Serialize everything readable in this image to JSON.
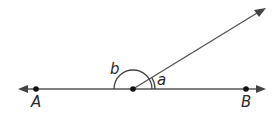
{
  "diagram": {
    "type": "geometry-angles",
    "points": [
      {
        "id": "A",
        "label": "A"
      },
      {
        "id": "O",
        "label": ""
      },
      {
        "id": "B",
        "label": "B"
      }
    ],
    "angles": [
      {
        "id": "a",
        "label": "a"
      },
      {
        "id": "b",
        "label": "b"
      }
    ],
    "colors": {
      "stroke": "#444444",
      "dot": "#111111",
      "text": "#2a2a2a"
    }
  }
}
